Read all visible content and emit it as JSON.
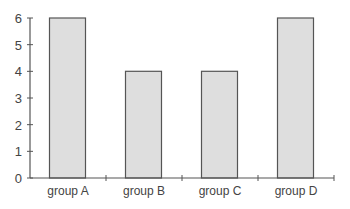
{
  "chart_data": {
    "type": "bar",
    "title": "",
    "xlabel": "",
    "ylabel": "",
    "categories": [
      "group A",
      "group B",
      "group C",
      "group D"
    ],
    "values": [
      6,
      4,
      4,
      6
    ],
    "ylim": [
      0,
      6
    ],
    "yticks": [
      0,
      1,
      2,
      3,
      4,
      5,
      6
    ],
    "grid": false,
    "legend": null,
    "colors": {
      "bar_fill": "#dedede",
      "bar_edge": "#555555",
      "axis": "#555555",
      "text": "#444444"
    }
  }
}
